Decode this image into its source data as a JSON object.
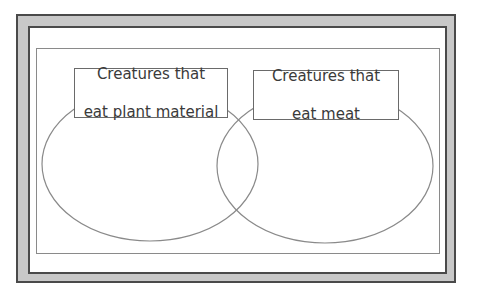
{
  "diagram": {
    "type": "venn",
    "circles": [
      {
        "id": "plant",
        "label_line1": "Creatures that",
        "label_line2": "eat plant material"
      },
      {
        "id": "meat",
        "label_line1": "Creatures that",
        "label_line2": "eat meat"
      }
    ],
    "colors": {
      "frame_border": "#4a4a4a",
      "frame_band": "#c8c8c8",
      "ellipse_stroke": "#8a8a8a",
      "text": "#3a3a3a"
    }
  }
}
